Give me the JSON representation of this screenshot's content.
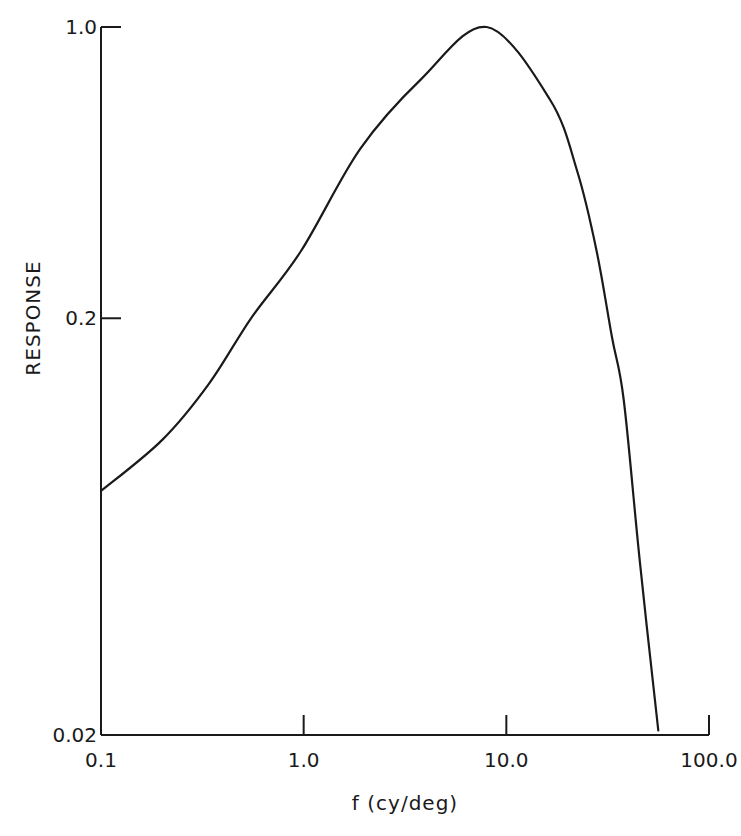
{
  "chart_data": {
    "type": "line",
    "title": "",
    "xlabel": "f (cy/deg)",
    "ylabel": "RESPONSE",
    "xscale": "log",
    "yscale": "log",
    "xlim": [
      0.1,
      100.0
    ],
    "ylim": [
      0.02,
      1.0
    ],
    "xticks": [
      "0.1",
      "1.0",
      "10.0",
      "100.0"
    ],
    "yticks": [
      "0.02",
      "0.2",
      "1.0"
    ],
    "grid": false,
    "legend": null,
    "series": [
      {
        "name": "response",
        "x": [
          0.1,
          0.2,
          0.34,
          0.55,
          0.97,
          1.9,
          3.8,
          8.0,
          16.4,
          22.4,
          27.9,
          33.2,
          38.0,
          45.6,
          56.2
        ],
        "y": [
          0.077,
          0.102,
          0.139,
          0.2,
          0.29,
          0.51,
          0.75,
          1.0,
          0.67,
          0.45,
          0.29,
          0.18,
          0.127,
          0.052,
          0.0205
        ]
      }
    ]
  },
  "labels": {
    "xlabel": "f (cy/deg)",
    "ylabel": "RESPONSE",
    "xticks": [
      "0.1",
      "1.0",
      "10.0",
      "100.0"
    ],
    "yticks": [
      "0.02",
      "0.2",
      "1.0"
    ]
  }
}
